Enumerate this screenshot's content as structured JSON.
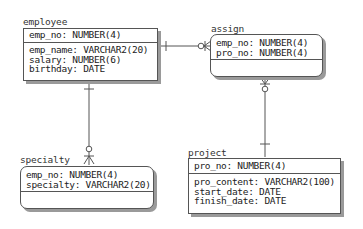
{
  "entities": {
    "employee": {
      "name": "employee",
      "keys": [
        "emp_no: NUMBER(4)"
      ],
      "attributes": [
        "emp_name: VARCHAR2(20)",
        "salary: NUMBER(6)",
        "birthday: DATE"
      ]
    },
    "assign": {
      "name": "assign",
      "keys": [
        "emp_no: NUMBER(4)",
        "pro_no: NUMBER(4)"
      ],
      "attributes": []
    },
    "specialty": {
      "name": "specialty",
      "keys": [
        "emp_no: NUMBER(4)",
        "specialty: VARCHAR2(20)"
      ],
      "attributes": []
    },
    "project": {
      "name": "project",
      "keys": [
        "pro_no: NUMBER(4)"
      ],
      "attributes": [
        "pro_content: VARCHAR2(100)",
        "start_date: DATE",
        "finish_date: DATE"
      ]
    }
  },
  "relationships": [
    {
      "from": "employee",
      "to": "assign",
      "from_cardinality": "one",
      "to_cardinality": "zero-or-many"
    },
    {
      "from": "employee",
      "to": "specialty",
      "from_cardinality": "one",
      "to_cardinality": "zero-or-many"
    },
    {
      "from": "project",
      "to": "assign",
      "from_cardinality": "one",
      "to_cardinality": "zero-or-many"
    }
  ],
  "colors": {
    "line": "#555555",
    "shadow": "#9a9a9a",
    "background": "#ffffff"
  }
}
